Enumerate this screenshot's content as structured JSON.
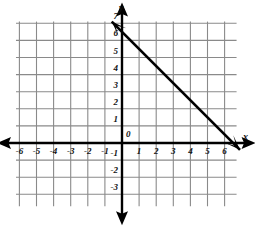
{
  "chart_data": {
    "type": "line",
    "title": "",
    "xlabel": "x",
    "ylabel": "y",
    "grid": true,
    "legend": false,
    "xlim": [
      -7,
      7
    ],
    "ylim": [
      -4,
      8
    ],
    "x_ticks": [
      -6,
      -5,
      -4,
      -3,
      -2,
      -1,
      1,
      2,
      3,
      4,
      5,
      6
    ],
    "y_ticks": [
      1,
      2,
      3,
      4,
      5,
      6,
      7,
      -1,
      -2,
      -3
    ],
    "x_tick_labels": [
      "-6",
      "-5",
      "-4",
      "-3",
      "-2",
      "-1",
      "1",
      "2",
      "3",
      "4",
      "5",
      "6"
    ],
    "y_tick_labels": [
      "1",
      "2",
      "3",
      "4",
      "5",
      "6",
      "7",
      "-1",
      "-2",
      "-3"
    ],
    "origin_label": "0",
    "series": [
      {
        "name": "line",
        "slope": -1,
        "y_intercept": 6.5,
        "x_intercept": 6.5,
        "points": [
          [
            -0.6,
            7.1
          ],
          [
            6.9,
            -0.4
          ]
        ],
        "color": "#000000"
      }
    ]
  },
  "axes": {
    "x_axis_name": "x",
    "y_axis_name": "y",
    "origin": "0"
  },
  "ticks": {
    "x_negative": [
      "-6",
      "-5",
      "-4",
      "-3",
      "-2",
      "-1"
    ],
    "x_positive": [
      "1",
      "2",
      "3",
      "4",
      "5",
      "6"
    ],
    "y_positive": [
      "1",
      "2",
      "3",
      "4",
      "5",
      "6",
      "7"
    ],
    "y_negative": [
      "-1",
      "-2",
      "-3"
    ]
  },
  "colors": {
    "grid": "#8a8a8a",
    "axis": "#000000",
    "line": "#000000",
    "background": "#ffffff",
    "text": "#111111"
  }
}
